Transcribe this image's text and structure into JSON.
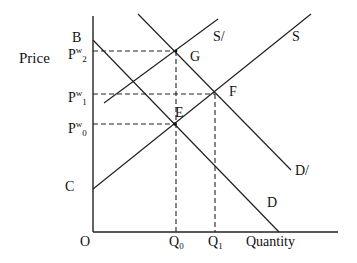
{
  "diagram": {
    "type": "supply-demand",
    "axes": {
      "y_label": "Price",
      "x_label": "Quantity",
      "origin_label": "O"
    },
    "price_levels": [
      {
        "id": "pw2",
        "base": "P",
        "sup": "w",
        "sub": "2"
      },
      {
        "id": "pw1",
        "base": "P",
        "sup": "w",
        "sub": "1"
      },
      {
        "id": "pw0",
        "base": "P",
        "sup": "w",
        "sub": "0"
      }
    ],
    "quantity_levels": [
      {
        "id": "q0",
        "base": "Q",
        "sub": "0"
      },
      {
        "id": "q1",
        "base": "Q",
        "sub": "1"
      }
    ],
    "intercepts": {
      "b": "B",
      "c": "C"
    },
    "points": {
      "g": "G",
      "f": "F",
      "e": "E"
    },
    "curves": {
      "s": "S",
      "s_prime": "S/",
      "d": "D",
      "d_prime": "D/"
    }
  }
}
